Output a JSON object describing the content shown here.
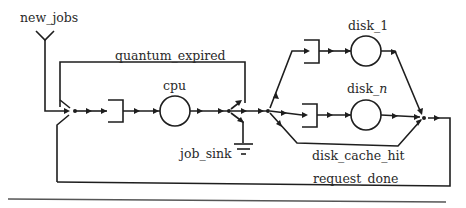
{
  "diagram": {
    "type": "queueing-network",
    "labels": {
      "new_jobs": "new_jobs",
      "quantum_expired": "quantum_expired",
      "cpu": "cpu",
      "job_sink": "job_sink",
      "disk_1": "disk_1",
      "disk_n_prefix": "disk_",
      "disk_n_suffix": "n",
      "disk_cache_hit": "disk_cache_hit",
      "request_done": "request_done"
    },
    "nodes": [
      {
        "id": "new_jobs",
        "kind": "source"
      },
      {
        "id": "cpu",
        "kind": "queue+server"
      },
      {
        "id": "job_sink",
        "kind": "sink"
      },
      {
        "id": "disk_1",
        "kind": "queue+server"
      },
      {
        "id": "disk_n",
        "kind": "queue+server"
      }
    ],
    "edges": [
      {
        "from": "new_jobs",
        "to": "cpu"
      },
      {
        "from": "cpu",
        "to": "cpu",
        "label": "quantum_expired"
      },
      {
        "from": "cpu",
        "to": "job_sink"
      },
      {
        "from": "cpu",
        "to": "disk_1"
      },
      {
        "from": "cpu",
        "to": "disk_n"
      },
      {
        "from": "cpu",
        "to": "merge",
        "label": "disk_cache_hit"
      },
      {
        "from": "merge",
        "to": "cpu",
        "label": "request_done"
      }
    ]
  }
}
